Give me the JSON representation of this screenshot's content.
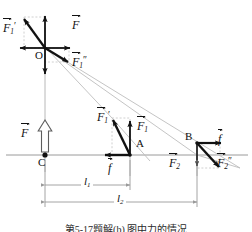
{
  "figure": {
    "caption": "第5-17题解(b)  图中力的情况",
    "points": [
      {
        "name": "O",
        "label": "O",
        "x": 45,
        "y": 48
      },
      {
        "name": "A",
        "label": "A",
        "x": 130,
        "y": 155
      },
      {
        "name": "B",
        "label": "B",
        "x": 197,
        "y": 155
      },
      {
        "name": "C",
        "label": "C",
        "x": 45,
        "y": 155
      }
    ],
    "vectors": [
      {
        "name": "F-origin",
        "base": "F",
        "sub": "",
        "prime": "",
        "label_x": 72,
        "label_y": 18
      },
      {
        "name": "F1-prime-origin",
        "base": "F",
        "sub": "1",
        "prime": "′",
        "label_x": 4,
        "label_y": 22
      },
      {
        "name": "F1-dprime-origin",
        "base": "F",
        "sub": "1",
        "prime": "″",
        "label_x": 72,
        "label_y": 55
      },
      {
        "name": "F1-prime-A",
        "base": "F",
        "sub": "1",
        "prime": "′",
        "label_x": 98,
        "label_y": 112
      },
      {
        "name": "F1-A",
        "base": "F",
        "sub": "1",
        "prime": "",
        "label_x": 138,
        "label_y": 122
      },
      {
        "name": "f-A",
        "base": "f",
        "sub": "",
        "prime": "",
        "label_x": 107,
        "label_y": 163
      },
      {
        "name": "f-B",
        "base": "f",
        "sub": "",
        "prime": "",
        "label_x": 217,
        "label_y": 136
      },
      {
        "name": "F2-B",
        "base": "F",
        "sub": "2",
        "prime": "",
        "label_x": 170,
        "label_y": 158
      },
      {
        "name": "F2-dprime-B",
        "base": "F",
        "sub": "2",
        "prime": "″",
        "label_x": 218,
        "label_y": 158
      },
      {
        "name": "F-C",
        "base": "F",
        "sub": "",
        "prime": "",
        "label_x": 22,
        "label_y": 128
      }
    ],
    "dimensions": [
      {
        "name": "l1",
        "base": "l",
        "sub": "1",
        "label_x": 82,
        "label_y": 177,
        "x1": 45,
        "x2": 130,
        "y": 185
      },
      {
        "name": "l2",
        "base": "l",
        "sub": "2",
        "label_x": 115,
        "label_y": 194,
        "x1": 45,
        "x2": 197,
        "y": 202
      }
    ],
    "colors": {
      "ink": "#111111",
      "axis": "#9a9a9a",
      "construction": "#b4b4b4",
      "guide": "#c0c0c0"
    }
  }
}
